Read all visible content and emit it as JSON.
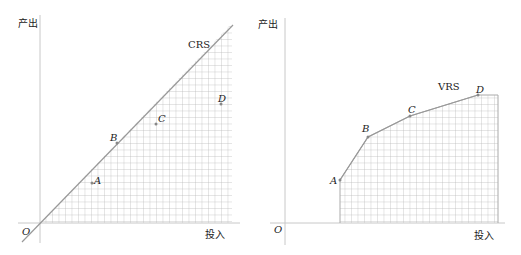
{
  "left_panel": {
    "title_label": "CRS",
    "y_axis_label": "产出",
    "x_axis_label": "投入",
    "origin_label": "O",
    "points": [
      {
        "name": "A",
        "x": 92,
        "y": 183
      },
      {
        "name": "B",
        "x": 117,
        "y": 143
      },
      {
        "name": "C",
        "x": 156,
        "y": 124
      },
      {
        "name": "D",
        "x": 221,
        "y": 104
      }
    ]
  },
  "right_panel": {
    "title_label": "VRS",
    "y_axis_label": "产出",
    "x_axis_label": "投入",
    "origin_label": "O",
    "points": [
      {
        "name": "A",
        "x": 340,
        "y": 180
      },
      {
        "name": "B",
        "x": 368,
        "y": 137
      },
      {
        "name": "C",
        "x": 410,
        "y": 116
      },
      {
        "name": "D",
        "x": 478,
        "y": 95
      }
    ]
  },
  "colors": {
    "axis": "#bbbbbb",
    "frontier": "#999999",
    "grid": "#b5b5b5"
  }
}
